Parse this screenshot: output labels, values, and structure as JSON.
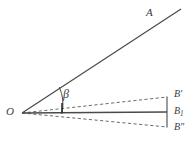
{
  "figure": {
    "type": "geometry-diagram",
    "background_color": "#ffffff",
    "stroke_color": "#4a4a4a",
    "label_color": "#3a3a3a",
    "labels": {
      "vertex_O": "O",
      "ray_A": "A",
      "angle_beta": "β",
      "point_B_prime": "B′",
      "point_B_one_base": "B",
      "point_B_one_sub": "1",
      "point_B_double_prime": "B″"
    },
    "elements": {
      "ray_OA": {
        "name": "ray-OA",
        "style": "solid",
        "from": [
          22,
          113
        ],
        "to": [
          181,
          9
        ]
      },
      "line_OB1": {
        "name": "line-OB1",
        "style": "solid",
        "from": [
          22,
          113
        ],
        "to": [
          167,
          112
        ]
      },
      "line_OBprime": {
        "name": "line-OB-prime",
        "style": "dashed",
        "from": [
          22,
          113
        ],
        "to": [
          167,
          97
        ]
      },
      "line_OBdoubleprime": {
        "name": "line-OB-double-prime",
        "style": "dashed",
        "from": [
          22,
          113
        ],
        "to": [
          167,
          127
        ]
      },
      "bracket_right": {
        "name": "right-bracket",
        "style": "solid",
        "from": [
          167,
          97
        ],
        "to": [
          167,
          127
        ]
      },
      "angle_arc": {
        "name": "angle-arc-beta",
        "style": "solid",
        "center": [
          22,
          113
        ],
        "radius": 40
      },
      "angle_tick": {
        "name": "angle-tick-mark",
        "style": "solid",
        "from": [
          62,
          104
        ],
        "to": [
          62,
          113
        ]
      }
    }
  }
}
